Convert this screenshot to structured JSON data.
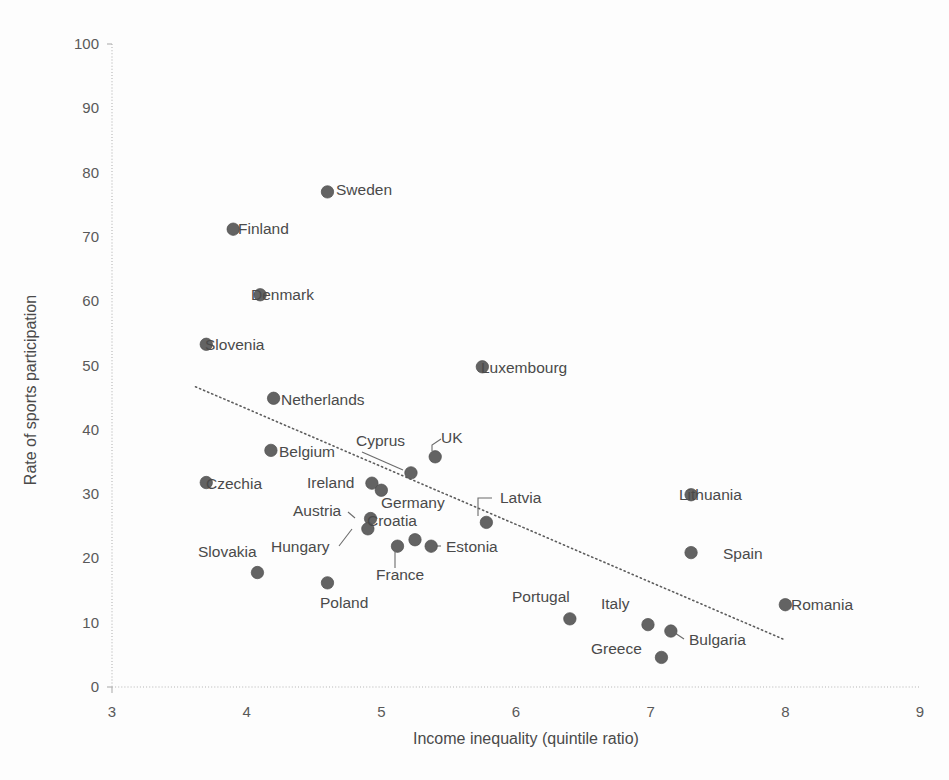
{
  "chart_data": {
    "type": "scatter",
    "title": "",
    "xlabel": "Income inequality (quintile ratio)",
    "ylabel": "Rate of sports participation",
    "xlim": [
      3,
      9
    ],
    "ylim": [
      0,
      100
    ],
    "xticks": [
      "3",
      "4",
      "5",
      "6",
      "7",
      "8",
      "9"
    ],
    "yticks": [
      "0",
      "10",
      "20",
      "30",
      "40",
      "50",
      "60",
      "70",
      "80",
      "90",
      "100"
    ],
    "grid": false,
    "legend": "none",
    "marker_color": "#636363",
    "trendline": {
      "style": "dotted",
      "color": "#5d5d5d",
      "x_start": 3.62,
      "y_start": 46.7,
      "x_end": 8.0,
      "y_end": 7.3
    },
    "points": [
      {
        "label": "Sweden",
        "x": 4.6,
        "y": 77.0,
        "lx": 336,
        "ly": 195,
        "anchor": "start",
        "leader": null
      },
      {
        "label": "Finland",
        "x": 3.9,
        "y": 71.2,
        "lx": 238,
        "ly": 234,
        "anchor": "start",
        "leader": null
      },
      {
        "label": "Denmark",
        "x": 4.1,
        "y": 61.0,
        "lx": 251,
        "ly": 300,
        "anchor": "start",
        "leader": null
      },
      {
        "label": "Slovenia",
        "x": 3.7,
        "y": 53.3,
        "lx": 205,
        "ly": 350,
        "anchor": "start",
        "leader": null
      },
      {
        "label": "Luxembourg",
        "x": 5.75,
        "y": 49.8,
        "lx": 481,
        "ly": 373,
        "anchor": "start",
        "leader": null
      },
      {
        "label": "Netherlands",
        "x": 4.2,
        "y": 44.9,
        "lx": 281,
        "ly": 405,
        "anchor": "start",
        "leader": null
      },
      {
        "label": "Belgium",
        "x": 4.18,
        "y": 36.8,
        "lx": 279,
        "ly": 457,
        "anchor": "start",
        "leader": null
      },
      {
        "label": "UK",
        "x": 5.4,
        "y": 35.8,
        "lx": 441,
        "ly": 443,
        "anchor": "start",
        "leader": [
          432,
          451,
          432,
          445,
          441,
          439
        ]
      },
      {
        "label": "Cyprus",
        "x": 5.22,
        "y": 33.3,
        "lx": 356,
        "ly": 446,
        "anchor": "start",
        "leader": [
          403,
          470,
          362,
          452
        ]
      },
      {
        "label": "Czechia",
        "x": 3.7,
        "y": 31.8,
        "lx": 206,
        "ly": 489,
        "anchor": "start",
        "leader": null
      },
      {
        "label": "Ireland",
        "x": 4.93,
        "y": 31.7,
        "lx": 307,
        "ly": 488,
        "anchor": "start",
        "leader": null
      },
      {
        "label": "Lithuania",
        "x": 7.3,
        "y": 29.9,
        "lx": 679,
        "ly": 500,
        "anchor": "start",
        "leader": null
      },
      {
        "label": "Germany",
        "x": 5.0,
        "y": 30.6,
        "lx": 381,
        "ly": 508,
        "anchor": "start",
        "leader": null
      },
      {
        "label": "Latvia",
        "x": 5.78,
        "y": 25.6,
        "lx": 500,
        "ly": 503,
        "anchor": "start",
        "leader": [
          478,
          516,
          478,
          498,
          492,
          498
        ]
      },
      {
        "label": "Austria",
        "x": 4.92,
        "y": 26.2,
        "lx": 293,
        "ly": 516,
        "anchor": "start",
        "leader": [
          355,
          518,
          348,
          512
        ]
      },
      {
        "label": "Croatia",
        "x": 5.25,
        "y": 22.9,
        "lx": 367,
        "ly": 526,
        "anchor": "start",
        "leader": null
      },
      {
        "label": "Hungary",
        "x": 4.9,
        "y": 24.6,
        "lx": 271,
        "ly": 552,
        "anchor": "start",
        "leader": [
          339,
          546,
          352,
          529
        ]
      },
      {
        "label": "Estonia",
        "x": 5.37,
        "y": 21.9,
        "lx": 446,
        "ly": 552,
        "anchor": "start",
        "leader": [
          427,
          546,
          441,
          546
        ]
      },
      {
        "label": "Spain",
        "x": 7.3,
        "y": 20.9,
        "lx": 723,
        "ly": 559,
        "anchor": "start",
        "leader": null
      },
      {
        "label": "France",
        "x": 5.12,
        "y": 21.9,
        "lx": 376,
        "ly": 580,
        "anchor": "start",
        "leader": [
          395,
          552,
          395,
          568
        ]
      },
      {
        "label": "Slovakia",
        "x": 4.08,
        "y": 17.8,
        "lx": 198,
        "ly": 557,
        "anchor": "start",
        "leader": null
      },
      {
        "label": "Poland",
        "x": 4.6,
        "y": 16.2,
        "lx": 320,
        "ly": 608,
        "anchor": "start",
        "leader": null
      },
      {
        "label": "Romania",
        "x": 8.0,
        "y": 12.8,
        "lx": 791,
        "ly": 610,
        "anchor": "start",
        "leader": null
      },
      {
        "label": "Portugal",
        "x": 6.4,
        "y": 10.6,
        "lx": 512,
        "ly": 602,
        "anchor": "start",
        "leader": null
      },
      {
        "label": "Italy",
        "x": 6.98,
        "y": 9.7,
        "lx": 601,
        "ly": 609,
        "anchor": "start",
        "leader": null
      },
      {
        "label": "Bulgaria",
        "x": 7.15,
        "y": 8.7,
        "lx": 689,
        "ly": 645,
        "anchor": "start",
        "leader": [
          675,
          633,
          684,
          639
        ]
      },
      {
        "label": "Greece",
        "x": 7.08,
        "y": 4.6,
        "lx": 591,
        "ly": 654,
        "anchor": "start",
        "leader": null
      }
    ]
  }
}
